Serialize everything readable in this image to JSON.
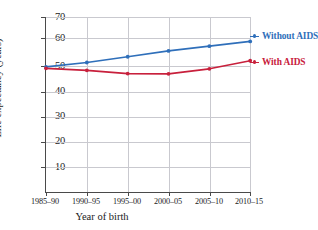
{
  "chart_data": {
    "type": "line",
    "title": "",
    "xlabel": "Year of birth",
    "ylabel": "Life expectancy (years)",
    "categories": [
      "1985–90",
      "1990–95",
      "1995–00",
      "2000–05",
      "2005–10",
      "2010–15"
    ],
    "ylim": [
      0,
      70
    ],
    "yticks": [
      10,
      20,
      30,
      40,
      50,
      60,
      70
    ],
    "grid": true,
    "legend_position": "right-inline",
    "series": [
      {
        "name": "Without AIDS",
        "color": "#2f6fba",
        "values": [
          50.2,
          51.9,
          54.2,
          56.5,
          58.4,
          60.3
        ]
      },
      {
        "name": "With AIDS",
        "color": "#c8203c",
        "values": [
          49.6,
          48.8,
          47.5,
          47.4,
          49.4,
          52.6
        ]
      }
    ]
  },
  "axis": {
    "y_title": "Life expectancy (years)",
    "x_title": "Year of birth",
    "y_ticks": [
      "70",
      "60",
      "50",
      "40",
      "30",
      "20",
      "10"
    ],
    "x_ticks": [
      "1985–90",
      "1990–95",
      "1995–00",
      "2000–05",
      "2005–10",
      "2010–15"
    ]
  },
  "legend": {
    "items": [
      {
        "label": "Without AIDS",
        "color": "#2f6fba"
      },
      {
        "label": "With AIDS",
        "color": "#c8203c"
      }
    ]
  },
  "colors": {
    "without_aids": "#2f6fba",
    "with_aids": "#c8203c",
    "grid": "#c9c9cf",
    "axis": "#4a4a4a",
    "background": "#ffffff"
  }
}
